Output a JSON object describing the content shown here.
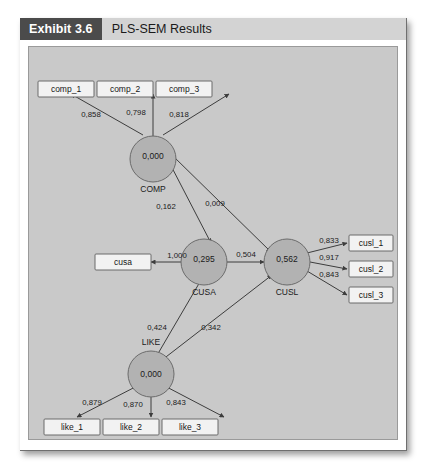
{
  "exhibit": {
    "tag": "Exhibit 3.6",
    "title": "PLS-SEM Results"
  },
  "diagram": {
    "type": "pls-sem-path-model",
    "decimal_separator": ",",
    "indicators": [
      {
        "id": "comp_1",
        "label": "comp_1"
      },
      {
        "id": "comp_2",
        "label": "comp_2"
      },
      {
        "id": "comp_3",
        "label": "comp_3"
      },
      {
        "id": "cusa",
        "label": "cusa"
      },
      {
        "id": "cusl_1",
        "label": "cusl_1"
      },
      {
        "id": "cusl_2",
        "label": "cusl_2"
      },
      {
        "id": "cusl_3",
        "label": "cusl_3"
      },
      {
        "id": "like_1",
        "label": "like_1"
      },
      {
        "id": "like_2",
        "label": "like_2"
      },
      {
        "id": "like_3",
        "label": "like_3"
      }
    ],
    "constructs": [
      {
        "id": "COMP",
        "name": "COMP",
        "value": "0,000"
      },
      {
        "id": "LIKE",
        "name": "LIKE",
        "value": "0,000"
      },
      {
        "id": "CUSA",
        "name": "CUSA",
        "value": "0,295"
      },
      {
        "id": "CUSL",
        "name": "CUSL",
        "value": "0,562"
      }
    ],
    "outer_loadings": [
      {
        "from": "COMP",
        "to": "comp_1",
        "value": "0,858"
      },
      {
        "from": "COMP",
        "to": "comp_2",
        "value": "0,798"
      },
      {
        "from": "COMP",
        "to": "comp_3",
        "value": "0,818"
      },
      {
        "from": "CUSA",
        "to": "cusa",
        "value": "1,000"
      },
      {
        "from": "CUSL",
        "to": "cusl_1",
        "value": "0,833"
      },
      {
        "from": "CUSL",
        "to": "cusl_2",
        "value": "0,917"
      },
      {
        "from": "CUSL",
        "to": "cusl_3",
        "value": "0,843"
      },
      {
        "from": "LIKE",
        "to": "like_1",
        "value": "0,879"
      },
      {
        "from": "LIKE",
        "to": "like_2",
        "value": "0,870"
      },
      {
        "from": "LIKE",
        "to": "like_3",
        "value": "0,843"
      }
    ],
    "path_coefficients": [
      {
        "from": "COMP",
        "to": "CUSA",
        "value": "0,162"
      },
      {
        "from": "COMP",
        "to": "CUSL",
        "value": "0,009"
      },
      {
        "from": "LIKE",
        "to": "CUSA",
        "value": "0,424"
      },
      {
        "from": "LIKE",
        "to": "CUSL",
        "value": "0,342"
      },
      {
        "from": "CUSA",
        "to": "CUSL",
        "value": "0,504"
      }
    ]
  }
}
